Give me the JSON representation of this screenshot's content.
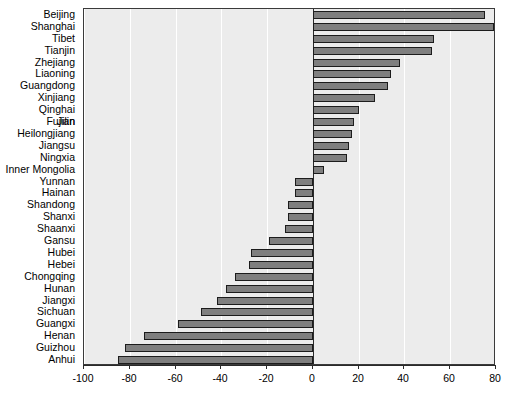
{
  "chart_data": {
    "type": "bar",
    "orientation": "horizontal",
    "title": "",
    "subtitle": "",
    "xlabel": "",
    "ylabel": "",
    "xlim": [
      -100,
      80
    ],
    "xticks": [
      -100,
      -80,
      -60,
      -40,
      -20,
      0,
      20,
      40,
      60,
      80
    ],
    "xticklabels": [
      "-100",
      "-80",
      "-60",
      "-40",
      "-20",
      "0",
      "20",
      "40",
      "60",
      "80"
    ],
    "grid": true,
    "legend": "none",
    "bar_color": "#7f7f7f",
    "bar_edge_color": "#1c1c1c",
    "plot_background": "#ececec",
    "categories": [
      "Beijing",
      "Shanghai",
      "Tibet",
      "Tianjin",
      "Zhejiang",
      "Liaoning",
      "Guangdong",
      "Xinjiang",
      "Qinghai",
      "Fujian",
      "Jilin",
      "Heilongjiang",
      "Jiangsu",
      "Ningxia",
      "Inner Mongolia",
      "Yunnan",
      "Hainan",
      "Shandong",
      "Shanxi",
      "Shaanxi",
      "Gansu",
      "Hubei",
      "Hebei",
      "Chongqing",
      "Hunan",
      "Jiangxi",
      "Sichuan",
      "Guangxi",
      "Henan",
      "Guizhou",
      "Anhui"
    ],
    "values": [
      75,
      79,
      53,
      52,
      38,
      34,
      33,
      27,
      20,
      18,
      18,
      17,
      16,
      15,
      5,
      -8,
      -8,
      -11,
      -11,
      -12,
      -19,
      -27,
      -28,
      -34,
      -38,
      -42,
      -49,
      -59,
      -74,
      -82,
      -85
    ],
    "overlapping_labels_note": "Fujian and Jilin labels render on top of each other at the same row"
  }
}
